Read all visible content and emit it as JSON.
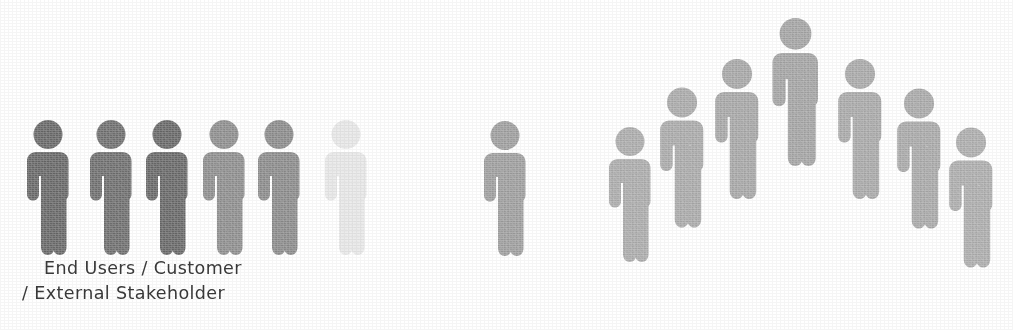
{
  "figure": {
    "background_color": "#ffffff",
    "icon_name": "person-pictogram-icon"
  },
  "caption": {
    "line1": "End Users / Customer",
    "line2": "/ External Stakeholder",
    "color": "#3a3a3a"
  },
  "groups": [
    {
      "name": "left-group",
      "label_ref": "caption",
      "count": 6,
      "arrangement": "row",
      "people": [
        {
          "id": "left-person-1",
          "color": "#666666",
          "x": 22,
          "y": 117,
          "w": 52,
          "h": 142
        },
        {
          "id": "left-person-2",
          "color": "#6d6d6d",
          "x": 85,
          "y": 117,
          "w": 52,
          "h": 142
        },
        {
          "id": "left-person-3",
          "color": "#666666",
          "x": 141,
          "y": 117,
          "w": 52,
          "h": 142
        },
        {
          "id": "left-person-4",
          "color": "#8d8d8d",
          "x": 198,
          "y": 117,
          "w": 52,
          "h": 142
        },
        {
          "id": "left-person-5",
          "color": "#8a8a8a",
          "x": 253,
          "y": 117,
          "w": 52,
          "h": 142
        },
        {
          "id": "left-person-6",
          "color": "#e7e7e7",
          "x": 320,
          "y": 117,
          "w": 52,
          "h": 142
        }
      ]
    },
    {
      "name": "middle-group",
      "count": 1,
      "arrangement": "single",
      "people": [
        {
          "id": "middle-person-1",
          "color": "#9d9d9d",
          "x": 479,
          "y": 119,
          "w": 52,
          "h": 140
        }
      ]
    },
    {
      "name": "right-group",
      "count": 7,
      "arrangement": "arc",
      "people": [
        {
          "id": "right-person-1",
          "color": "#ababab",
          "x": 604,
          "y": 124,
          "w": 52,
          "h": 142
        },
        {
          "id": "right-person-2",
          "color": "#a9a9a9",
          "x": 655,
          "y": 85,
          "w": 54,
          "h": 146
        },
        {
          "id": "right-person-3",
          "color": "#a6a6a6",
          "x": 710,
          "y": 56,
          "w": 54,
          "h": 147
        },
        {
          "id": "right-person-4",
          "color": "#a3a3a3",
          "x": 767,
          "y": 15,
          "w": 57,
          "h": 155
        },
        {
          "id": "right-person-5",
          "color": "#a8a8a8",
          "x": 833,
          "y": 56,
          "w": 54,
          "h": 147
        },
        {
          "id": "right-person-6",
          "color": "#a8a8a8",
          "x": 892,
          "y": 85,
          "w": 54,
          "h": 148
        },
        {
          "id": "right-person-7",
          "color": "#acacac",
          "x": 944,
          "y": 124,
          "w": 54,
          "h": 148
        }
      ]
    }
  ]
}
